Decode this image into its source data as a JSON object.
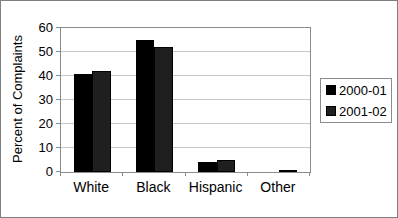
{
  "chart_data": {
    "type": "bar",
    "title": "",
    "xlabel": "",
    "ylabel": "Percent of Complaints",
    "categories": [
      "White",
      "Black",
      "Hispanic",
      "Other"
    ],
    "series": [
      {
        "name": "2000-01",
        "color": "#000000",
        "values": [
          41,
          55,
          4,
          0
        ]
      },
      {
        "name": "2001-02",
        "color": "#1f1f1f",
        "values": [
          42,
          52,
          5,
          1
        ]
      }
    ],
    "ylim": [
      0,
      60
    ],
    "yticks": [
      0,
      10,
      20,
      30,
      40,
      50,
      60
    ],
    "grid": true,
    "legend_position": "right"
  },
  "colors": {
    "background": "#ffffff",
    "frame_border": "#7f7f7f",
    "plot_border": "#8c8c8c",
    "gridline": "#c6c6c6",
    "text": "#000000"
  }
}
